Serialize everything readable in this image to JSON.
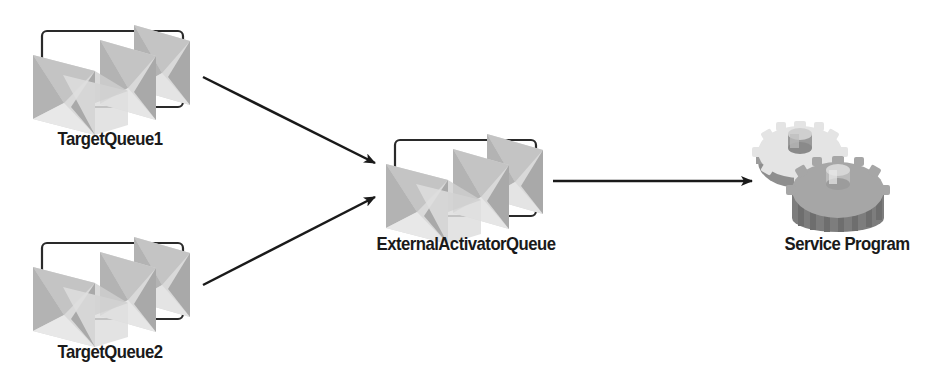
{
  "diagram": {
    "type": "flow",
    "colors": {
      "background": "#ffffff",
      "arrow": "#1a1a1a",
      "box_border": "#2a2a2a",
      "envelope_light": "#e2e2e2",
      "envelope_mid": "#c8c8c8",
      "envelope_dark": "#a9a9a9",
      "gear_light": "#e6e6e6",
      "gear_dark": "#9a9a9a",
      "label": "#1a1a1a"
    },
    "nodes": [
      {
        "id": "target1",
        "label": "TargetQueue1",
        "icon": "message-queue-icon"
      },
      {
        "id": "target2",
        "label": "TargetQueue2",
        "icon": "message-queue-icon"
      },
      {
        "id": "external",
        "label": "ExternalActivatorQueue",
        "icon": "message-queue-icon"
      },
      {
        "id": "service",
        "label": "Service Program",
        "icon": "gears-icon"
      }
    ],
    "edges": [
      {
        "from": "TargetQueue1",
        "to": "ExternalActivatorQueue"
      },
      {
        "from": "TargetQueue2",
        "to": "ExternalActivatorQueue"
      },
      {
        "from": "ExternalActivatorQueue",
        "to": "Service Program"
      }
    ]
  }
}
